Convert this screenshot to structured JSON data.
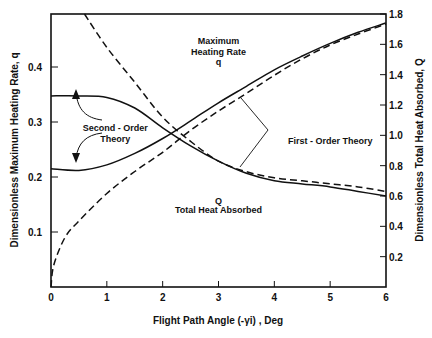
{
  "chart_data": {
    "type": "line",
    "title": "",
    "xlabel": "Flight Path Angle (-γi) , Deg",
    "ylabel": "Dimensionless Maximum Heating Rate, q",
    "y2label": "Dimensionless Total Heat Absorbed, Q",
    "xlim": [
      0,
      6
    ],
    "ylim": [
      0,
      0.5
    ],
    "y2lim": [
      0,
      1.8
    ],
    "grid": false,
    "x_ticks": [
      "0",
      "1",
      "2",
      "3",
      "4",
      "5",
      "6"
    ],
    "y_ticks": [
      "0.1",
      "0.2",
      "0.3",
      "0.4"
    ],
    "y2_ticks": [
      "0.2",
      "0.4",
      "0.6",
      "0.8",
      "1.0",
      "1.2",
      "1.4",
      "1.6",
      "1.8"
    ],
    "series": [
      {
        "name": "Maximum Heating Rate q — Second-Order Theory",
        "axis": "left",
        "style": "solid",
        "x": [
          0,
          0.5,
          1.0,
          1.5,
          2.0,
          2.5,
          3.0,
          3.5,
          4.0,
          4.5,
          5.0,
          5.5,
          6.0
        ],
        "y": [
          0.215,
          0.212,
          0.222,
          0.243,
          0.27,
          0.302,
          0.335,
          0.365,
          0.395,
          0.42,
          0.443,
          0.463,
          0.48
        ]
      },
      {
        "name": "Maximum Heating Rate q — First-Order Theory",
        "axis": "left",
        "style": "dashed",
        "x": [
          0,
          0.05,
          0.25,
          0.5,
          1.0,
          1.5,
          2.0,
          2.5,
          3.0,
          3.5,
          4.0,
          4.5,
          5.0,
          5.5,
          6.0
        ],
        "y": [
          0.0,
          0.04,
          0.09,
          0.12,
          0.17,
          0.21,
          0.245,
          0.285,
          0.32,
          0.352,
          0.385,
          0.415,
          0.44,
          0.46,
          0.478
        ]
      },
      {
        "name": "Total Heat Absorbed Q — Second-Order Theory",
        "axis": "right",
        "style": "solid",
        "x": [
          0,
          0.5,
          1.0,
          1.5,
          2.0,
          2.5,
          3.0,
          3.5,
          4.0,
          4.5,
          5.0,
          5.5,
          6.0
        ],
        "y": [
          1.26,
          1.26,
          1.25,
          1.18,
          1.05,
          0.93,
          0.83,
          0.75,
          0.7,
          0.68,
          0.66,
          0.63,
          0.6
        ]
      },
      {
        "name": "Total Heat Absorbed Q — First-Order Theory",
        "axis": "right",
        "style": "dashed",
        "x": [
          0.6,
          1.0,
          1.5,
          2.0,
          2.5,
          3.0,
          3.5,
          4.0,
          4.5,
          5.0,
          5.5,
          6.0
        ],
        "y": [
          1.8,
          1.58,
          1.35,
          1.12,
          0.96,
          0.83,
          0.76,
          0.72,
          0.7,
          0.68,
          0.66,
          0.63
        ]
      }
    ],
    "annotations": [
      {
        "text": "Maximum",
        "x": 3.0,
        "y_left": 0.447
      },
      {
        "text": "Heating Rate",
        "x": 3.0,
        "y_left": 0.428
      },
      {
        "text": "q",
        "x": 3.0,
        "y_left": 0.41
      },
      {
        "text": "Second - Order",
        "x": 1.15,
        "y_left": 0.29
      },
      {
        "text": "Theory",
        "x": 1.15,
        "y_left": 0.27
      },
      {
        "text": "First - Order Theory",
        "x": 5.0,
        "y_left": 0.265
      },
      {
        "text": "Q",
        "x": 3.0,
        "y_left": 0.157
      },
      {
        "text": "Total Heat Absorbed",
        "x": 3.0,
        "y_left": 0.14
      }
    ]
  }
}
